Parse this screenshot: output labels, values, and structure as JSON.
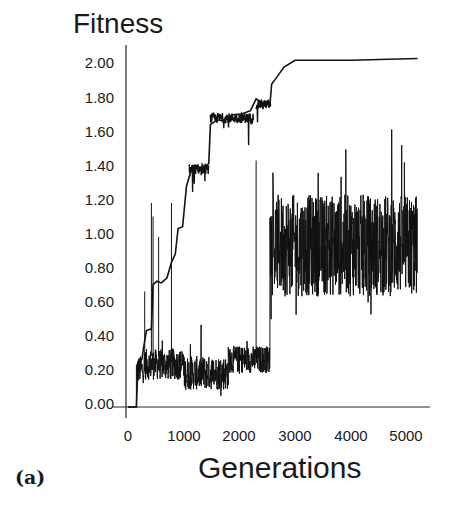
{
  "chart_data": {
    "type": "line",
    "title": "Fitness",
    "xlabel": "Generations",
    "ylabel": "Fitness",
    "panel_label": "(a)",
    "xlim": [
      0,
      5300
    ],
    "ylim": [
      0,
      2.05
    ],
    "x_ticks": [
      "0",
      "1000",
      "2000",
      "3000",
      "4000",
      "5000"
    ],
    "y_ticks": [
      "2.00",
      "1.80",
      "1.60",
      "1.40",
      "1.20",
      "1.00",
      "0.80",
      "0.60",
      "0.40",
      "0.20",
      "0.00"
    ],
    "grid": false,
    "legend": null,
    "series": [
      {
        "name": "Maximum fitness",
        "style": "thin line with occasional spikes",
        "points": [
          [
            0,
            0.0
          ],
          [
            150,
            0.0
          ],
          [
            180,
            0.25
          ],
          [
            250,
            0.28
          ],
          [
            280,
            0.35
          ],
          [
            330,
            0.45
          ],
          [
            420,
            0.46
          ],
          [
            450,
            0.72
          ],
          [
            520,
            0.74
          ],
          [
            600,
            0.73
          ],
          [
            700,
            0.76
          ],
          [
            780,
            0.85
          ],
          [
            850,
            0.9
          ],
          [
            900,
            1.05
          ],
          [
            980,
            1.06
          ],
          [
            1050,
            1.3
          ],
          [
            1150,
            1.42
          ],
          [
            1250,
            1.4
          ],
          [
            1350,
            1.38
          ],
          [
            1450,
            1.42
          ],
          [
            1480,
            1.65
          ],
          [
            1600,
            1.7
          ],
          [
            1700,
            1.68
          ],
          [
            1800,
            1.71
          ],
          [
            1900,
            1.72
          ],
          [
            2050,
            1.73
          ],
          [
            2200,
            1.74
          ],
          [
            2300,
            1.8
          ],
          [
            2450,
            1.79
          ],
          [
            2550,
            1.78
          ],
          [
            2580,
            1.9
          ],
          [
            2650,
            1.93
          ],
          [
            2800,
            2.0
          ],
          [
            3000,
            2.04
          ],
          [
            4000,
            2.04
          ],
          [
            5200,
            2.05
          ]
        ],
        "spikes": [
          [
            300,
            0.68
          ],
          [
            420,
            1.2
          ],
          [
            450,
            1.12
          ],
          [
            550,
            1.0
          ],
          [
            780,
            1.2
          ],
          [
            2300,
            1.45
          ]
        ]
      },
      {
        "name": "Average fitness",
        "style": "dense noisy line",
        "segments": [
          {
            "x": [
              150,
              300
            ],
            "mean": 0.22,
            "spread": 0.08
          },
          {
            "x": [
              300,
              1000
            ],
            "mean": 0.25,
            "spread": 0.09
          },
          {
            "x": [
              1000,
              1800
            ],
            "mean": 0.2,
            "spread": 0.1
          },
          {
            "x": [
              1800,
              2550
            ],
            "mean": 0.28,
            "spread": 0.08
          },
          {
            "x": [
              2550,
              5200
            ],
            "mean": 0.95,
            "spread": 0.3
          }
        ],
        "range_after_2550": [
          0.25,
          1.58
        ],
        "range_before_2550": [
          0.05,
          0.62
        ]
      }
    ]
  }
}
